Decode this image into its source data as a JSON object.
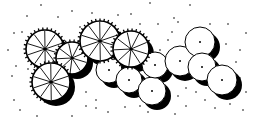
{
  "drawing": {
    "title": "Plan-view tree grouping sketch",
    "colors": {
      "ink": "#000000",
      "paper": "#ffffff"
    },
    "width": 264,
    "height": 128
  },
  "canopy_trees": [
    {
      "id": "tree-1",
      "cx": 45,
      "cy": 49,
      "r": 19,
      "spokes": 10
    },
    {
      "id": "tree-2",
      "cx": 72,
      "cy": 58,
      "r": 16,
      "spokes": 9
    },
    {
      "id": "tree-3",
      "cx": 100,
      "cy": 41,
      "r": 20,
      "spokes": 10
    },
    {
      "id": "tree-4",
      "cx": 131,
      "cy": 49,
      "r": 18,
      "spokes": 9
    },
    {
      "id": "tree-5",
      "cx": 51,
      "cy": 82,
      "r": 19,
      "spokes": 10
    }
  ],
  "round_shrubs": [
    {
      "id": "shrub-1",
      "cx": 109,
      "cy": 70,
      "r": 13
    },
    {
      "id": "shrub-2",
      "cx": 129,
      "cy": 80,
      "r": 13
    },
    {
      "id": "shrub-3",
      "cx": 152,
      "cy": 91,
      "r": 14
    },
    {
      "id": "shrub-4",
      "cx": 155,
      "cy": 65,
      "r": 13
    },
    {
      "id": "shrub-5",
      "cx": 180,
      "cy": 61,
      "r": 15
    },
    {
      "id": "shrub-6",
      "cx": 200,
      "cy": 42,
      "r": 15
    },
    {
      "id": "shrub-7",
      "cx": 202,
      "cy": 67,
      "r": 14
    },
    {
      "id": "shrub-8",
      "cx": 222,
      "cy": 80,
      "r": 15
    }
  ],
  "stipple_dots": [
    [
      41,
      5
    ],
    [
      72,
      11
    ],
    [
      150,
      3
    ],
    [
      190,
      5
    ],
    [
      27,
      16
    ],
    [
      58,
      17
    ],
    [
      92,
      13
    ],
    [
      118,
      15
    ],
    [
      131,
      14
    ],
    [
      174,
      18
    ],
    [
      14,
      33
    ],
    [
      22,
      32
    ],
    [
      80,
      27
    ],
    [
      140,
      24
    ],
    [
      158,
      24
    ],
    [
      178,
      22
    ],
    [
      210,
      24
    ],
    [
      228,
      24
    ],
    [
      246,
      33
    ],
    [
      8,
      50
    ],
    [
      16,
      66
    ],
    [
      28,
      69
    ],
    [
      12,
      76
    ],
    [
      14,
      100
    ],
    [
      20,
      110
    ],
    [
      37,
      116
    ],
    [
      72,
      116
    ],
    [
      86,
      106
    ],
    [
      96,
      108
    ],
    [
      108,
      112
    ],
    [
      125,
      107
    ],
    [
      140,
      106
    ],
    [
      148,
      112
    ],
    [
      160,
      104
    ],
    [
      175,
      114
    ],
    [
      186,
      106
    ],
    [
      205,
      100
    ],
    [
      215,
      108
    ],
    [
      230,
      104
    ],
    [
      243,
      110
    ],
    [
      246,
      92
    ],
    [
      236,
      62
    ],
    [
      226,
      44
    ],
    [
      240,
      50
    ],
    [
      168,
      40
    ],
    [
      172,
      32
    ],
    [
      160,
      50
    ],
    [
      186,
      88
    ],
    [
      196,
      92
    ],
    [
      178,
      96
    ],
    [
      86,
      92
    ],
    [
      96,
      100
    ],
    [
      240,
      78
    ]
  ]
}
